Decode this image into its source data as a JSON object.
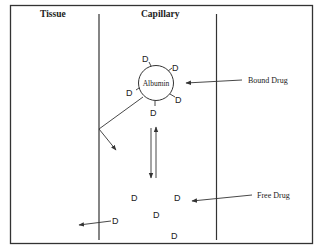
{
  "diagram": {
    "type": "drug-protein-binding",
    "headers": {
      "tissue": "Tissue",
      "capillary": "Capillary"
    },
    "protein_label": "Albumin",
    "annotations": {
      "bound_drug": "Bound Drug",
      "free_drug": "Free Drug"
    },
    "drug_symbol": "D",
    "bound_drugs": [
      "D",
      "D",
      "D",
      "D",
      "D",
      "D"
    ],
    "free_drugs": [
      "D",
      "D",
      "D",
      "D",
      "D"
    ],
    "edges": [
      {
        "from": "Albumin",
        "to": "Tissue",
        "type": "curved-arrow"
      },
      {
        "from": "Bound Drug",
        "to": "Free Drug",
        "type": "equilibrium-double-arrow"
      },
      {
        "from": "Free Drug",
        "to": "Tissue",
        "type": "arrow"
      }
    ]
  }
}
